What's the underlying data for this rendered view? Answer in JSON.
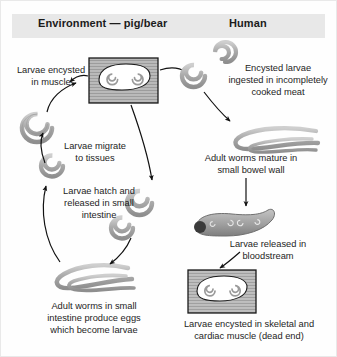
{
  "figure": {
    "title_implicit": "Trichinella life cycle",
    "columns": [
      {
        "key": "environment",
        "label": "Environment — pig/bear"
      },
      {
        "key": "human",
        "label": "Human"
      }
    ],
    "colors": {
      "header_band": "#e8e8e8",
      "worm_fill": "#b3b3b3",
      "worm_stroke": "#808080",
      "muscle_fill": "#bdbdbd",
      "muscle_stroke": "#1a1a1a",
      "cyst_fill": "#ffffff",
      "text": "#1d1d1d",
      "arrow": "#111111",
      "background": "#ffffff"
    }
  },
  "captions": {
    "larvae_encysted_muscle": "Larvae encysted\nin muscle",
    "larvae_migrate_tissues": "Larvae migrate\nto tissues",
    "larvae_hatch_released": "Larvae hatch and\nreleased in small\nintestine",
    "adult_worms_small_intestine": "Adult worms in small\nintestine produce eggs\nwhich become larvae",
    "encysted_larvae_ingested": "Encysted larvae\ningested in incompletely\ncooked meat",
    "adult_worms_mature_bowel": "Adult worms mature in\nsmall bowel wall",
    "larvae_released_bloodstream": "Larvae released in\nbloodstream",
    "larvae_encysted_skeletal": "Larvae encysted in skeletal and\ncardiac muscle (dead end)"
  },
  "elements": {
    "muscle_block_pig": "muscle tissue block containing encysted larvae (pig/bear)",
    "muscle_block_human": "muscle tissue block containing encysted larvae (human, dead end)",
    "coiled_larva_pig_migrating": "coiled larva migrating to tissues",
    "coiled_larva_pig_hatched_a": "coiled larva hatched in small intestine",
    "coiled_larva_pig_hatched_b": "coiled larva hatched in small intestine",
    "adult_worms_pig": "adult worms pair in small intestine",
    "coiled_larva_human_a": "encysted coiled larva ingested in meat",
    "coiled_larva_human_b": "encysted coiled larva ingested in meat",
    "adult_worms_human": "adult worm pair maturing in small bowel wall",
    "bowel_segment_human": "small bowel wall segment with larvae"
  },
  "arrows": [
    {
      "name": "arrow-muscle-to-migrate",
      "from": "muscle_block_pig",
      "to": "coiled_larva_pig_migrating"
    },
    {
      "name": "arrow-migrate-to-encysted",
      "from": "coiled_larva_pig_migrating",
      "to": "muscle_block_pig"
    },
    {
      "name": "arrow-hatch-to-migrate",
      "from": "coiled_larva_pig_hatched",
      "to": "coiled_larva_pig_migrating"
    },
    {
      "name": "arrow-muscle-to-hatch",
      "from": "muscle_block_pig",
      "to": "coiled_larva_pig_hatched"
    },
    {
      "name": "arrow-hatch-to-adult",
      "from": "coiled_larva_pig_hatched",
      "to": "adult_worms_pig"
    },
    {
      "name": "arrow-adult-to-muscle",
      "from": "adult_worms_pig",
      "to": "muscle_block_pig"
    },
    {
      "name": "arrow-pig-muscle-to-human-larvae",
      "from": "muscle_block_pig",
      "to": "coiled_larva_human"
    },
    {
      "name": "arrow-human-larvae-to-adults",
      "from": "coiled_larva_human",
      "to": "adult_worms_human"
    },
    {
      "name": "arrow-adults-to-bowel",
      "from": "adult_worms_human",
      "to": "bowel_segment_human"
    },
    {
      "name": "arrow-bowel-to-muscle",
      "from": "bowel_segment_human",
      "to": "muscle_block_human"
    }
  ]
}
